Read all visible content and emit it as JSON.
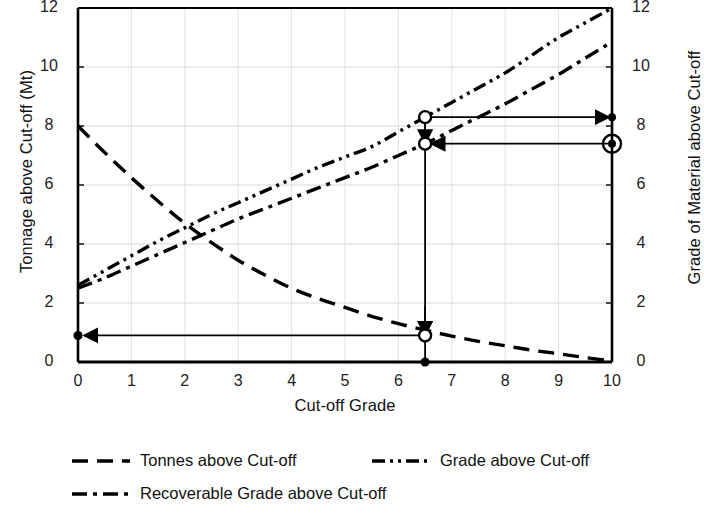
{
  "chart_data": {
    "type": "line",
    "title": "",
    "xlabel": "Cut-off Grade",
    "ylabel": "Tonnage above Cut-off (Mt)",
    "y2label": "Grade of Material above Cut-off",
    "xlim": [
      0,
      10
    ],
    "ylim": [
      0,
      12
    ],
    "y2lim": [
      0,
      12
    ],
    "grid": true,
    "legend_position": "below",
    "xticks": [
      "0",
      "1",
      "2",
      "3",
      "4",
      "5",
      "6",
      "7",
      "8",
      "9",
      "10"
    ],
    "yticks": [
      "0",
      "2",
      "4",
      "6",
      "8",
      "10",
      "12"
    ],
    "y2ticks": [
      "0",
      "2",
      "4",
      "6",
      "8",
      "10",
      "12"
    ],
    "series": [
      {
        "name": "Tonnes above Cut-off",
        "axis": "left",
        "dash": "long-dash",
        "x": [
          0,
          0.5,
          1,
          1.5,
          2,
          2.5,
          3,
          3.5,
          4,
          4.5,
          5,
          5.5,
          6,
          6.5,
          7,
          7.5,
          8,
          8.5,
          9,
          9.5,
          10
        ],
        "values": [
          8.0,
          7.1,
          6.25,
          5.45,
          4.7,
          4.05,
          3.45,
          2.95,
          2.5,
          2.15,
          1.85,
          1.55,
          1.3,
          1.08,
          0.88,
          0.7,
          0.55,
          0.4,
          0.28,
          0.15,
          0.03
        ]
      },
      {
        "name": "Grade above Cut-off",
        "axis": "right",
        "dash": "dash-dot-dot",
        "x": [
          0,
          0.5,
          1,
          1.5,
          2,
          2.5,
          3,
          3.5,
          4,
          4.5,
          5,
          5.5,
          6,
          6.5,
          7,
          7.5,
          8,
          8.5,
          9,
          9.5,
          10
        ],
        "values": [
          2.6,
          3.1,
          3.6,
          4.1,
          4.55,
          5.0,
          5.4,
          5.8,
          6.2,
          6.6,
          6.95,
          7.3,
          7.8,
          8.3,
          8.8,
          9.3,
          9.8,
          10.4,
          11.0,
          11.5,
          12.0
        ]
      },
      {
        "name": "Recoverable Grade above Cut-off",
        "axis": "right",
        "dash": "dash-dot",
        "x": [
          0,
          0.5,
          1,
          1.5,
          2,
          2.5,
          3,
          3.5,
          4,
          4.5,
          5,
          5.5,
          6,
          6.5,
          7,
          7.5,
          8,
          8.5,
          9,
          9.5,
          10
        ],
        "values": [
          2.5,
          2.85,
          3.25,
          3.65,
          4.05,
          4.45,
          4.85,
          5.2,
          5.55,
          5.9,
          6.25,
          6.6,
          7.0,
          7.4,
          7.85,
          8.3,
          8.75,
          9.25,
          9.75,
          10.3,
          10.85
        ]
      }
    ],
    "annotations": {
      "cutoff_x": 6.5,
      "grade_point": 8.3,
      "recoverable_grade_point": 7.4,
      "tonnage_point": 0.9
    }
  },
  "legend": [
    {
      "label": "Tonnes above Cut-off",
      "dash": "long-dash"
    },
    {
      "label": "Grade above Cut-off",
      "dash": "dash-dot-dot"
    },
    {
      "label": "Recoverable Grade above Cut-off",
      "dash": "dash-dot"
    }
  ],
  "axes": {
    "x_title": "Cut-off Grade",
    "y_left_title": "Tonnage above Cut-off (Mt)",
    "y_right_title": "Grade of Material above Cut-off"
  }
}
